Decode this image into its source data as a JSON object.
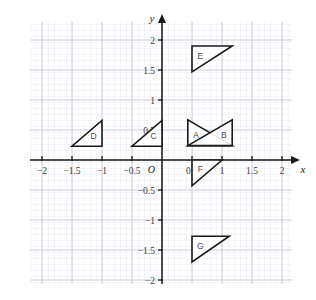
{
  "figure": {
    "type": "coordinate-plane",
    "width": 316,
    "height": 300,
    "background_color": "#ffffff",
    "grid": {
      "minor_color": "#e8eaf0",
      "major_color": "#c9ccd6",
      "minor_step_units": 0.1,
      "major_step_units": 0.5,
      "visible": true
    },
    "axis_color": "#1a1a1a",
    "shape_stroke_color": "#1a1a1a",
    "shape_fill_color": "#ffffff"
  },
  "axes": {
    "x_label": "x",
    "y_label": "y",
    "origin_label": "O",
    "x_ticks": [
      {
        "value": -2,
        "label": "−2"
      },
      {
        "value": -1.5,
        "label": "−1.5"
      },
      {
        "value": -1,
        "label": "−1"
      },
      {
        "value": -0.5,
        "label": "−0.5"
      },
      {
        "value": 0.5,
        "label": "0.5"
      },
      {
        "value": 1,
        "label": "1"
      },
      {
        "value": 1.5,
        "label": "1.5"
      },
      {
        "value": 2,
        "label": "2"
      }
    ],
    "y_ticks": [
      {
        "value": 2,
        "label": "2"
      },
      {
        "value": 1.5,
        "label": "1.5"
      },
      {
        "value": 1,
        "label": "1"
      },
      {
        "value": 0.5,
        "label": "0.5"
      },
      {
        "value": -0.5,
        "label": "−0.5"
      },
      {
        "value": -1,
        "label": "−1"
      },
      {
        "value": -1.5,
        "label": "−1.5"
      },
      {
        "value": -2,
        "label": "−2"
      }
    ],
    "xlim": [
      -2.35,
      2.35
    ],
    "ylim": [
      -2.35,
      2.35
    ]
  },
  "chart_data": {
    "type": "scatter",
    "title": "",
    "xlabel": "x",
    "ylabel": "y",
    "xlim": [
      -2.35,
      2.35
    ],
    "ylim": [
      -2.35,
      2.35
    ],
    "grid": true,
    "legend": "none",
    "shapes": [
      {
        "label": "A",
        "kind": "triangle",
        "vertices": [
          [
            0.43,
            0.67
          ],
          [
            0.43,
            0.24
          ],
          [
            1.17,
            0.24
          ]
        ],
        "label_position": [
          0.57,
          0.41
        ]
      },
      {
        "label": "B",
        "kind": "triangle",
        "vertices": [
          [
            1.17,
            0.67
          ],
          [
            1.17,
            0.24
          ],
          [
            0.43,
            0.24
          ]
        ],
        "label_position": [
          1.03,
          0.41
        ]
      },
      {
        "label": "C",
        "kind": "triangle",
        "vertices": [
          [
            -0.5,
            0.23
          ],
          [
            0.0,
            0.23
          ],
          [
            0.0,
            0.66
          ]
        ],
        "label_position": [
          -0.14,
          0.4
        ]
      },
      {
        "label": "D",
        "kind": "triangle",
        "vertices": [
          [
            -1.5,
            0.23
          ],
          [
            -1.0,
            0.23
          ],
          [
            -1.0,
            0.66
          ]
        ],
        "label_position": [
          -1.14,
          0.4
        ]
      },
      {
        "label": "E",
        "kind": "triangle",
        "vertices": [
          [
            0.5,
            1.9
          ],
          [
            1.17,
            1.9
          ],
          [
            0.5,
            1.47
          ]
        ],
        "label_position": [
          0.64,
          1.74
        ]
      },
      {
        "label": "F",
        "kind": "triangle",
        "vertices": [
          [
            0.5,
            0.0
          ],
          [
            1.0,
            0.0
          ],
          [
            0.5,
            -0.43
          ]
        ],
        "label_position": [
          0.64,
          -0.15
        ]
      },
      {
        "label": "G",
        "kind": "triangle",
        "vertices": [
          [
            0.5,
            -1.27
          ],
          [
            1.12,
            -1.27
          ],
          [
            0.5,
            -1.7
          ]
        ],
        "label_position": [
          0.64,
          -1.43
        ]
      }
    ]
  }
}
